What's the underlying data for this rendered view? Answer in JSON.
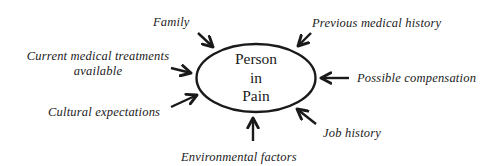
{
  "diagram": {
    "type": "influence-diagram",
    "center_node": {
      "lines": [
        "Person",
        "in",
        "Pain"
      ]
    },
    "factors": [
      {
        "id": "family",
        "label": "Family"
      },
      {
        "id": "current-medical-treatments",
        "label_lines": [
          "Current medical treatments",
          "available"
        ]
      },
      {
        "id": "cultural-expectations",
        "label": "Cultural expectations"
      },
      {
        "id": "environmental-factors",
        "label": "Environmental factors"
      },
      {
        "id": "job-history",
        "label": "Job history"
      },
      {
        "id": "possible-compensation",
        "label": "Possible compensation"
      },
      {
        "id": "previous-medical-history",
        "label": "Previous medical history"
      }
    ],
    "colors": {
      "stroke": "#1a1a1a",
      "background": "#ffffff"
    }
  }
}
